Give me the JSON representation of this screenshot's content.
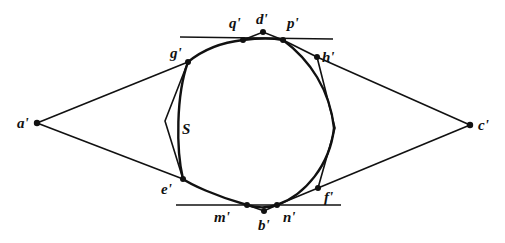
{
  "diagram": {
    "curve_label": "S",
    "points": {
      "a": {
        "label": "a'",
        "x": 37,
        "y": 123
      },
      "c": {
        "label": "c'",
        "x": 470,
        "y": 125
      },
      "d": {
        "label": "d'",
        "x": 263,
        "y": 32
      },
      "q": {
        "label": "q'",
        "x": 243,
        "y": 40
      },
      "p": {
        "label": "p'",
        "x": 283,
        "y": 40
      },
      "g": {
        "label": "g'",
        "x": 188,
        "y": 62
      },
      "h": {
        "label": "h'",
        "x": 317,
        "y": 57
      },
      "e": {
        "label": "e'",
        "x": 183,
        "y": 179
      },
      "f": {
        "label": "f'",
        "x": 318,
        "y": 188
      },
      "m": {
        "label": "m'",
        "x": 247,
        "y": 205
      },
      "b": {
        "label": "b'",
        "x": 264,
        "y": 211
      },
      "n": {
        "label": "n'",
        "x": 277,
        "y": 205
      }
    },
    "colors": {
      "ink": "#111111",
      "background": "#ffffff"
    }
  }
}
